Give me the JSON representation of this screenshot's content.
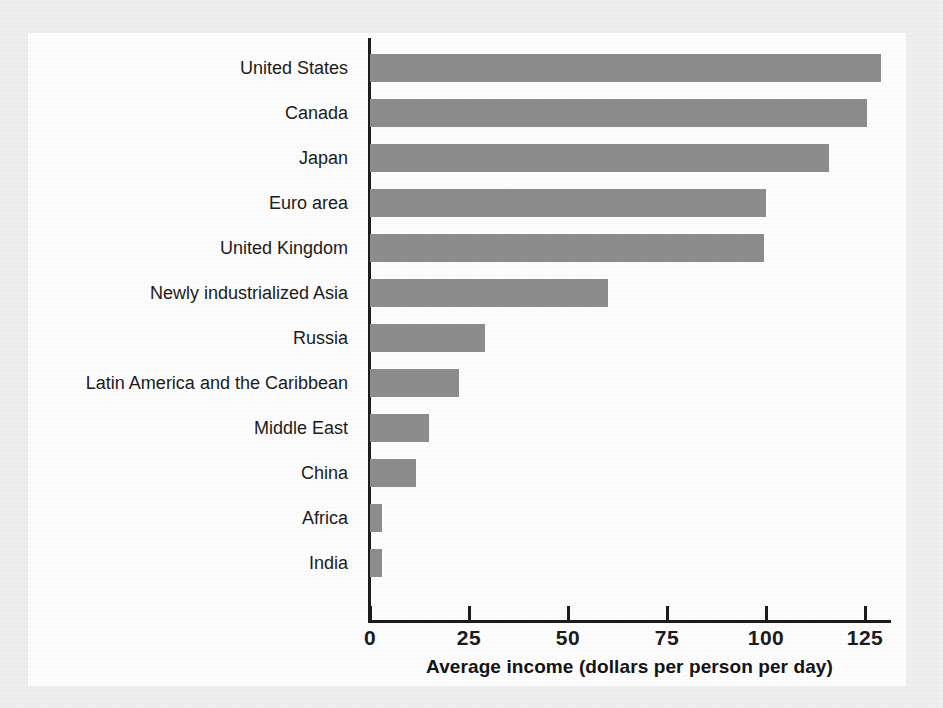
{
  "chart_data": {
    "type": "bar",
    "orientation": "horizontal",
    "title": "",
    "subtitle": "",
    "xlabel": "Average income (dollars per person per day)",
    "ylabel": "",
    "xlim": [
      0,
      132
    ],
    "xticks": [
      0,
      25,
      50,
      75,
      100,
      125
    ],
    "xtick_labels": [
      "0",
      "25",
      "50",
      "75",
      "100",
      "125"
    ],
    "grid": false,
    "legend": null,
    "bar_color": "#8d8d8d",
    "axis_color": "#1c1c1c",
    "background_color": "#fdfdfd",
    "page_color": "#efefef",
    "categories": [
      "United States",
      "Canada",
      "Japan",
      "Euro area",
      "United Kingdom",
      "Newly industrialized Asia",
      "Russia",
      "Latin America and the Caribbean",
      "Middle East",
      "China",
      "Africa",
      "India"
    ],
    "values": [
      129,
      125.5,
      116,
      100,
      99.5,
      60,
      29,
      22.5,
      15,
      11.5,
      3,
      3
    ],
    "series": [
      {
        "name": "Average income (dollars per person per day)",
        "values": [
          129,
          125.5,
          116,
          100,
          99.5,
          60,
          29,
          22.5,
          15,
          11.5,
          3,
          3
        ]
      }
    ]
  }
}
